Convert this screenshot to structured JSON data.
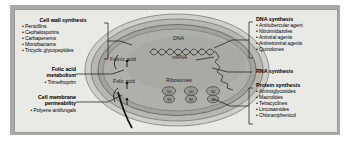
{
  "diagram": {
    "frame": {
      "border_color": "#a9a9a9",
      "background": "#e9e9e6"
    }
  },
  "cell": {
    "labels": {
      "dna": "DNA",
      "mrna": "mRNA",
      "ribosomes": "Ribosomes",
      "folinic_acid": "Folinic acid",
      "folic_acid": "Folic acid"
    },
    "ribosomes": [
      {
        "large_subunit": "50",
        "small_subunit": "30"
      },
      {
        "large_subunit": "50",
        "small_subunit": "30"
      },
      {
        "large_subunit": "50",
        "small_subunit": "30"
      }
    ],
    "colors": {
      "outer_wall": "#c9c9c4",
      "wall_band": "#a8a8a3",
      "membrane": "#8f8f8a",
      "cytoplasm": "#b4b4b0",
      "nucleoid": "#9d9d99"
    }
  },
  "groups": {
    "cell_wall_synthesis": {
      "heading": "Cell wall synthesis",
      "items": [
        "Penicillins",
        "Cephalosporins",
        "Carbapenems",
        "Monobactams",
        "Tricyclic glycopeptides"
      ]
    },
    "folic_acid_metabolism": {
      "heading_line1": "Folic acid",
      "heading_line2": "metabolism",
      "items": [
        "Trimethoprim"
      ]
    },
    "cell_membrane_permeability": {
      "heading_line1": "Cell membrane",
      "heading_line2": "permeability",
      "items": [
        "Polyene antifungals"
      ]
    },
    "dna_synthesis": {
      "heading": "DNA synthesis",
      "items": [
        "Antitubercular agent",
        "Nitroimidazoles",
        "Antiviral agents",
        "Antiretroviral agents",
        "Quinolones"
      ]
    },
    "rna_synthesis": {
      "heading": "RNA synthesis",
      "items": []
    },
    "protein_synthesis": {
      "heading": "Protein synthesis",
      "items": [
        "Aminoglycosides",
        "Macrolides",
        "Tetracyclines",
        "Lincosamides",
        "Chloramphenicol"
      ]
    }
  }
}
